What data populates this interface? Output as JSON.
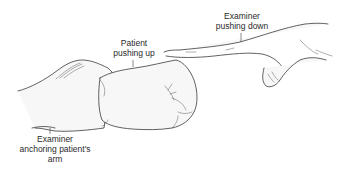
{
  "figure": {
    "labels": {
      "examiner_down": [
        "Examiner",
        "pushing down"
      ],
      "patient_up": [
        "Patient",
        "pushing up"
      ],
      "examiner_anchor": [
        "Examiner",
        "anchoring patient's",
        "arm"
      ]
    },
    "colors": {
      "background": "#ffffff",
      "line": "#3a3a3a",
      "text": "#2a2a2a"
    }
  }
}
